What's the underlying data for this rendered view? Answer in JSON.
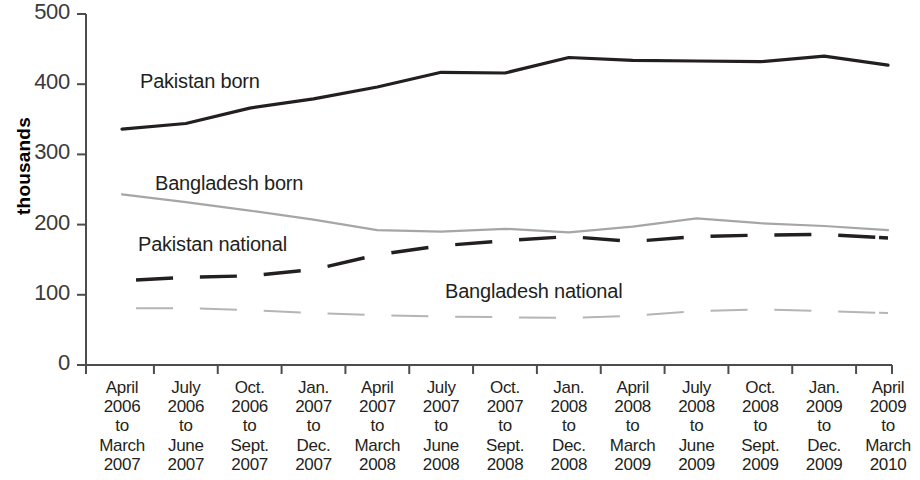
{
  "chart_data": {
    "type": "line",
    "title": "",
    "subtitle": "",
    "xlabel": "",
    "ylabel": "thousands",
    "ylim": [
      0,
      500
    ],
    "yticks": [
      0,
      100,
      200,
      300,
      400,
      500
    ],
    "grid": false,
    "legend_position": "inline-annotations",
    "categories": [
      "April 2006 to March 2007",
      "July 2006 to June 2007",
      "Oct. 2006 to Sept. 2007",
      "Jan. 2007 to Dec. 2007",
      "April 2007 to March 2008",
      "July 2007 to June 2008",
      "Oct. 2007 to Sept. 2008",
      "Jan. 2008 to Dec. 2008",
      "April 2008 to March 2009",
      "July 2008 to June 2009",
      "Oct. 2008 to Sept. 2009",
      "Jan. 2009 to Dec. 2009",
      "April 2009 to March 2010"
    ],
    "category_lines": [
      [
        "April",
        "2006",
        "to",
        "March",
        "2007"
      ],
      [
        "July",
        "2006",
        "to",
        "June",
        "2007"
      ],
      [
        "Oct.",
        "2006",
        "to",
        "Sept.",
        "2007"
      ],
      [
        "Jan.",
        "2007",
        "to",
        "Dec.",
        "2007"
      ],
      [
        "April",
        "2007",
        "to",
        "March",
        "2008"
      ],
      [
        "July",
        "2007",
        "to",
        "June",
        "2008"
      ],
      [
        "Oct.",
        "2007",
        "to",
        "Sept.",
        "2008"
      ],
      [
        "Jan.",
        "2008",
        "to",
        "Dec.",
        "2008"
      ],
      [
        "April",
        "2008",
        "to",
        "March",
        "2009"
      ],
      [
        "July",
        "2008",
        "to",
        "June",
        "2009"
      ],
      [
        "Oct.",
        "2008",
        "to",
        "Sept.",
        "2009"
      ],
      [
        "Jan.",
        "2009",
        "to",
        "Dec.",
        "2009"
      ],
      [
        "April",
        "2009",
        "to",
        "March",
        "2010"
      ]
    ],
    "series": [
      {
        "name": "Pakistan born",
        "style": "solid",
        "color": "#231f20",
        "width": 3.2,
        "values": [
          336,
          344,
          366,
          379,
          396,
          417,
          416,
          438,
          434,
          433,
          432,
          440,
          427
        ]
      },
      {
        "name": "Bangladesh born",
        "style": "solid",
        "color": "#a6a6a6",
        "width": 2.2,
        "values": [
          243,
          232,
          220,
          207,
          192,
          190,
          194,
          189,
          197,
          209,
          202,
          198,
          192
        ]
      },
      {
        "name": "Pakistan national",
        "style": "dashed",
        "color": "#231f20",
        "width": 3.4,
        "values": [
          120,
          125,
          127,
          136,
          157,
          170,
          177,
          183,
          176,
          183,
          185,
          186,
          181
        ]
      },
      {
        "name": "Bangladesh national",
        "style": "dashed",
        "color": "#b5b5b5",
        "width": 2.0,
        "values": [
          81,
          81,
          78,
          74,
          71,
          69,
          68,
          67,
          70,
          77,
          79,
          77,
          74
        ]
      }
    ],
    "annotations": [
      {
        "text": "Pakistan born",
        "x": 140,
        "y": 70
      },
      {
        "text": "Bangladesh born",
        "x": 155,
        "y": 172
      },
      {
        "text": "Pakistan national",
        "x": 138,
        "y": 233
      },
      {
        "text": "Bangladesh national",
        "x": 445,
        "y": 280
      }
    ]
  },
  "axis": {
    "y_title": "thousands",
    "y_tick_labels": [
      "500",
      "400",
      "300",
      "200",
      "100",
      "0"
    ]
  }
}
